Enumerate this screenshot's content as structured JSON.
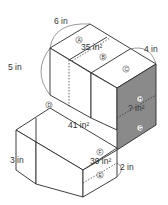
{
  "figure": {
    "type": "composite solid made of rectangular prisms (isometric view)",
    "dimensions": {
      "top_width": "6 in",
      "top_height": "5 in",
      "top_depth": "4 in",
      "bottom_left": "3 in",
      "bottom_right": "2 in"
    },
    "areas": {
      "top_face": "35 in²",
      "middle_face": "41 in²",
      "front_face": "39 in²",
      "shaded_face": "? in²"
    },
    "region_labels": {
      "A": "A",
      "B": "B",
      "C": "C",
      "D": "D",
      "E": "E",
      "F": "F",
      "G": "G",
      "H": "H"
    },
    "colors": {
      "line": "#2a2a2a",
      "shaded": "#8a8a8a",
      "face": "#ffffff"
    }
  }
}
